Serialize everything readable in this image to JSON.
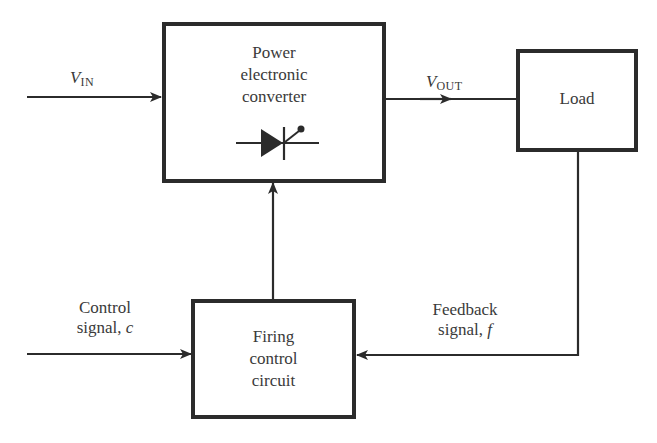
{
  "diagram": {
    "type": "block-diagram",
    "blocks": {
      "converter": {
        "line1": "Power",
        "line2": "electronic",
        "line3": "converter",
        "symbol": "thyristor-icon"
      },
      "load": {
        "label": "Load"
      },
      "firing": {
        "line1": "Firing",
        "line2": "control",
        "line3": "circuit"
      }
    },
    "signals": {
      "vin": {
        "var": "V",
        "sub": "IN"
      },
      "vout": {
        "var": "V",
        "sub": "OUT"
      },
      "control": {
        "line1": "Control",
        "line2_text": "signal, ",
        "line2_var": "c"
      },
      "feedback": {
        "line1": "Feedback",
        "line2_text": "signal, ",
        "line2_var": "f"
      }
    },
    "connections": [
      {
        "from": "V_IN",
        "to": "Power electronic converter"
      },
      {
        "from": "Power electronic converter",
        "to": "Load",
        "label": "V_OUT"
      },
      {
        "from": "Load",
        "to": "Firing control circuit",
        "label": "Feedback signal, f"
      },
      {
        "from": "Control signal, c",
        "to": "Firing control circuit"
      },
      {
        "from": "Firing control circuit",
        "to": "Power electronic converter"
      }
    ],
    "colors": {
      "stroke": "#2b2b2b",
      "text": "#3a3a3a",
      "background": "#ffffff"
    }
  }
}
